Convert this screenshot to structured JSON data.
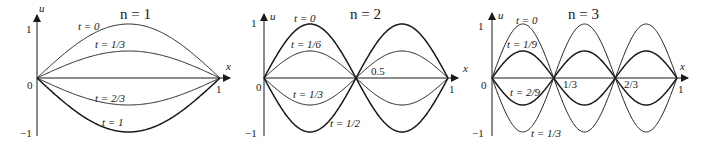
{
  "figure": {
    "background": "#ffffff",
    "ink": "#1a1a1a"
  },
  "chart_data": [
    {
      "type": "line",
      "title": "n = 1",
      "xlabel": "x",
      "ylabel": "u",
      "xlim": [
        0,
        1
      ],
      "ylim": [
        -1,
        1
      ],
      "x_ticks": [
        "0",
        "1"
      ],
      "y_ticks": [
        "1",
        "-1"
      ],
      "grid": false,
      "n": 1,
      "series": [
        {
          "name": "t = 0",
          "amplitude": 1,
          "bold": false
        },
        {
          "name": "t = 1/3",
          "amplitude": 0.5,
          "bold": false
        },
        {
          "name": "t = 2/3",
          "amplitude": -0.5,
          "bold": false
        },
        {
          "name": "t = 1",
          "amplitude": -1,
          "bold": true
        }
      ],
      "x_annotations": []
    },
    {
      "type": "line",
      "title": "n = 2",
      "xlabel": "x",
      "ylabel": "u",
      "xlim": [
        0,
        1
      ],
      "ylim": [
        -1,
        1
      ],
      "x_ticks": [
        "0",
        "1"
      ],
      "y_ticks": [
        "1",
        "-1"
      ],
      "grid": false,
      "n": 2,
      "series": [
        {
          "name": "t = 0",
          "amplitude": 1,
          "bold": true
        },
        {
          "name": "t = 1/6",
          "amplitude": 0.5,
          "bold": false
        },
        {
          "name": "t = 1/3",
          "amplitude": -0.5,
          "bold": false
        },
        {
          "name": "t = 1/2",
          "amplitude": -1,
          "bold": true
        }
      ],
      "x_annotations": [
        "0.5"
      ]
    },
    {
      "type": "line",
      "title": "n = 3",
      "xlabel": "x",
      "ylabel": "u",
      "xlim": [
        0,
        1
      ],
      "ylim": [
        -1,
        1
      ],
      "x_ticks": [
        "0",
        "1"
      ],
      "y_ticks": [
        "1",
        "-1"
      ],
      "grid": false,
      "n": 3,
      "series": [
        {
          "name": "t = 0",
          "amplitude": 1,
          "bold": false
        },
        {
          "name": "t = 1/9",
          "amplitude": 0.5,
          "bold": true
        },
        {
          "name": "t = 2/9",
          "amplitude": -0.5,
          "bold": true
        },
        {
          "name": "t = 1/3",
          "amplitude": -1,
          "bold": false
        }
      ],
      "x_annotations": [
        "1/3",
        "2/3"
      ]
    }
  ],
  "panels": [
    {
      "title": "n = 1",
      "axis_x": "x",
      "axis_y": "u",
      "tick_origin": "0",
      "tick_x_end": "1",
      "tick_y_top": "1",
      "tick_y_bottom": "−1",
      "labels": {
        "l0": "t = 0",
        "l1": "t = 1/3",
        "l2": "t = 2/3",
        "l3": "t = 1"
      },
      "extra": []
    },
    {
      "title": "n = 2",
      "axis_x": "x",
      "axis_y": "u",
      "tick_origin": "0",
      "tick_x_end": "1",
      "tick_y_top": "1",
      "tick_y_bottom": "−1",
      "labels": {
        "l0": "t = 0",
        "l1": "t = 1/6",
        "l2": "t = 1/3",
        "l3": "t = 1/2"
      },
      "extra": [
        "0.5"
      ]
    },
    {
      "title": "n = 3",
      "axis_x": "x",
      "axis_y": "u",
      "tick_origin": "0",
      "tick_x_end": "1",
      "tick_y_top": "1",
      "tick_y_bottom": "−1",
      "labels": {
        "l0": "t = 0",
        "l1": "t = 1/9",
        "l2": "t = 2/9",
        "l3": "t = 1/3"
      },
      "extra": [
        "1/3",
        "2/3"
      ]
    }
  ]
}
